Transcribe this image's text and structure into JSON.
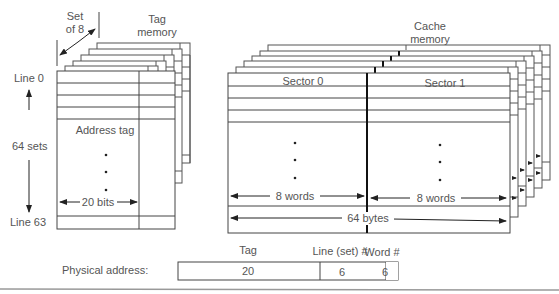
{
  "tag_memory": {
    "label_line1": "Tag",
    "label_line2": "memory",
    "set_label_line1": "Set",
    "set_label_line2": "of 8",
    "line_first": "Line 0",
    "line_last": "Line 63",
    "sets_label": "64 sets",
    "field_label": "Address tag",
    "width_label": "20 bits",
    "stack_depth": 8
  },
  "cache_memory": {
    "label_line1": "Cache",
    "label_line2": "memory",
    "sector0": "Sector 0",
    "sector1": "Sector 1",
    "sector0_width": "8 words",
    "sector1_width": "8 words",
    "line_width": "64 bytes",
    "stack_depth": 8
  },
  "physical_address": {
    "label": "Physical address:",
    "fields": [
      {
        "header": "Tag",
        "bits": "20"
      },
      {
        "header": "Line (set) #",
        "bits": "6"
      },
      {
        "header": "Word #",
        "bits": "6"
      }
    ]
  },
  "colors": {
    "line": "#444444",
    "text": "#555555",
    "rule": "#999999"
  }
}
